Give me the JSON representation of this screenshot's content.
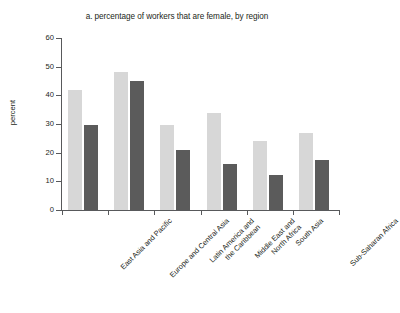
{
  "chart_data": {
    "type": "bar",
    "title": "a. percentage of workers that are female, by region",
    "xlabel": "",
    "ylabel": "percent",
    "ylim": [
      0,
      60
    ],
    "yticks": [
      0,
      10,
      20,
      30,
      40,
      50,
      60
    ],
    "grid": false,
    "legend": "none",
    "categories": [
      "East Asia and Pacific",
      "Europe and Central Asia",
      "Latin America and\nthe Caribbean",
      "Middle East and\nNorth Africa",
      "South Asia",
      "Sub-Saharan Africa"
    ],
    "series": [
      {
        "name": "series-1",
        "color": "#d7d7d7",
        "values": [
          42,
          48,
          29.5,
          34,
          24,
          27
        ]
      },
      {
        "name": "series-2",
        "color": "#5b5b5b",
        "values": [
          29.5,
          45,
          21,
          16,
          12.3,
          17.3
        ]
      }
    ]
  },
  "axis": {
    "y_tick_labels": [
      "0",
      "10",
      "20",
      "30",
      "40",
      "50",
      "60"
    ],
    "y_title": "percent"
  },
  "colors": {
    "light_bar": "#d7d7d7",
    "dark_bar": "#5b5b5b",
    "axis": "#58595b",
    "text": "#231f20",
    "background": "#ffffff"
  }
}
